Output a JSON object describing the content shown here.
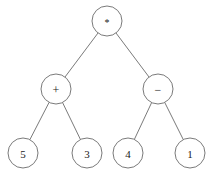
{
  "figure": {
    "width": 214,
    "height": 173,
    "background_color": "#ffffff",
    "stroke_color": "#6b6b6b",
    "text_color": "#1a1a1a",
    "node_radius": 15
  },
  "chart_data": {
    "type": "diagram",
    "diagram_kind": "binary-expression-tree",
    "expression": "(5 + 3) * (4 - 1)",
    "title": "",
    "nodes": [
      {
        "id": "root",
        "label": "*",
        "role": "operator",
        "depth": 0,
        "cx": 107,
        "cy": 21
      },
      {
        "id": "plus",
        "label": "+",
        "role": "operator",
        "depth": 1,
        "cx": 56,
        "cy": 89
      },
      {
        "id": "minus",
        "label": "−",
        "role": "operator",
        "depth": 1,
        "cx": 158,
        "cy": 89
      },
      {
        "id": "leaf5",
        "label": "5",
        "role": "operand",
        "depth": 2,
        "cx": 23,
        "cy": 153
      },
      {
        "id": "leaf3",
        "label": "3",
        "role": "operand",
        "depth": 2,
        "cx": 87,
        "cy": 153
      },
      {
        "id": "leaf4",
        "label": "4",
        "role": "operand",
        "depth": 2,
        "cx": 128,
        "cy": 153
      },
      {
        "id": "leaf1",
        "label": "1",
        "role": "operand",
        "depth": 2,
        "cx": 190,
        "cy": 153
      }
    ],
    "edges": [
      {
        "from": "root",
        "to": "plus"
      },
      {
        "from": "root",
        "to": "minus"
      },
      {
        "from": "plus",
        "to": "leaf5"
      },
      {
        "from": "plus",
        "to": "leaf3"
      },
      {
        "from": "minus",
        "to": "leaf4"
      },
      {
        "from": "minus",
        "to": "leaf1"
      }
    ]
  }
}
